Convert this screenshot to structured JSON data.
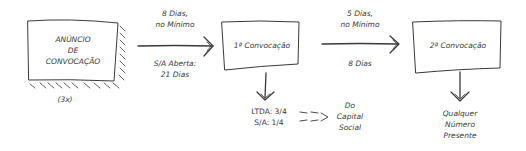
{
  "diagram": {
    "nodes": {
      "announcement": {
        "lines": [
          "ANÚNCIO",
          "DE",
          "CONVOCAÇÃO"
        ],
        "note": "(3x)"
      },
      "first_call": {
        "label": "1ª Convocação"
      },
      "second_call": {
        "label": "2ª Convocação"
      }
    },
    "edges": {
      "announce_to_first": {
        "above": [
          "8 Dias,",
          "no Mínimo"
        ],
        "below": [
          "S/A Aberta:",
          "21 Dias"
        ]
      },
      "first_to_second": {
        "above": [
          "5 Dias,",
          "no Mínimo"
        ],
        "below": [
          "8 Dias"
        ]
      }
    },
    "first_call_quorum": {
      "lines": [
        "LTDA: 3/4",
        "S/A: 1/4"
      ],
      "target": [
        "Do",
        "Capital",
        "Social"
      ]
    },
    "second_call_quorum": {
      "lines": [
        "Qualquer",
        "Número",
        "Presente"
      ]
    }
  },
  "colors": {
    "stroke": "#3a3a3a",
    "background": "#ffffff"
  }
}
